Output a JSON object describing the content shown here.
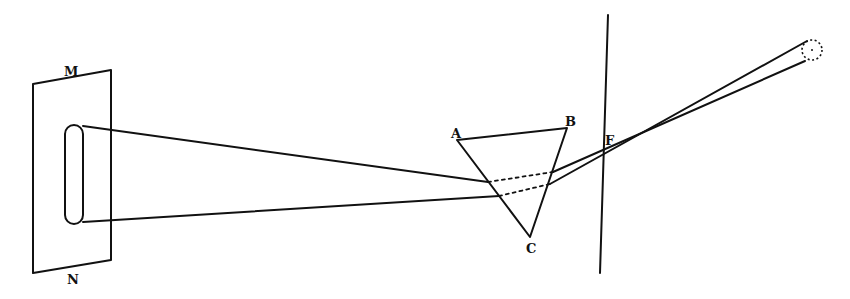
{
  "diagram": {
    "colors": {
      "ink": "#111111",
      "background": "#ffffff"
    },
    "labels": {
      "screen_top": "M",
      "screen_bottom": "N",
      "prism_a": "A",
      "prism_b": "B",
      "prism_c": "C",
      "aperture": "F"
    },
    "elements": [
      {
        "id": "screen",
        "type": "parallelogram",
        "labels": [
          "M",
          "N"
        ]
      },
      {
        "id": "slot-image",
        "type": "rounded-slot",
        "description": "elongated spectrum image on screen"
      },
      {
        "id": "prism",
        "type": "triangle",
        "vertices": [
          "A",
          "B",
          "C"
        ]
      },
      {
        "id": "shutter",
        "type": "vertical-line",
        "aperture": "F"
      },
      {
        "id": "sun",
        "type": "dotted-circle"
      },
      {
        "id": "rays",
        "type": "light-rays",
        "note": "dotted inside prism"
      }
    ]
  }
}
